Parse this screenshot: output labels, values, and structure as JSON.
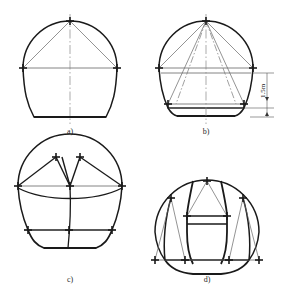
{
  "figure": {
    "panel_count": 4
  },
  "panels": [
    {
      "id": "a",
      "caption": "a)",
      "description": "full-face arch section with crown and springline points"
    },
    {
      "id": "b",
      "caption": "b)",
      "description": "arch section with radial rays, springline bench and lower bench"
    },
    {
      "id": "c",
      "caption": "c)",
      "description": "arch section with twin crown headings and lower benches"
    },
    {
      "id": "d",
      "caption": "d)",
      "description": "arch section with central core pillar and side drifts"
    }
  ],
  "dimension": {
    "value": "1.5m",
    "panel": "b",
    "orientation": "vertical"
  },
  "colors": {
    "outline": "#1a1a1a",
    "thin_line": "#555555",
    "center_line": "#777777",
    "background": "#ffffff"
  }
}
